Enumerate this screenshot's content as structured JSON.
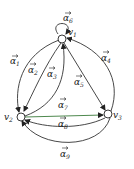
{
  "diagram": {
    "type": "directed-multigraph",
    "vertices": [
      {
        "id": "v1",
        "label": "v",
        "sub": "1"
      },
      {
        "id": "v2",
        "label": "v",
        "sub": "2"
      },
      {
        "id": "v3",
        "label": "v",
        "sub": "3"
      }
    ],
    "edges": [
      {
        "id": "a1",
        "label": "α",
        "sub": "1",
        "from": "v1",
        "to": "v2"
      },
      {
        "id": "a2",
        "label": "α",
        "sub": "2",
        "from": "v1",
        "to": "v2"
      },
      {
        "id": "a3",
        "label": "α",
        "sub": "3",
        "from": "v2",
        "to": "v1"
      },
      {
        "id": "a4",
        "label": "α",
        "sub": "4",
        "from": "v3",
        "to": "v1"
      },
      {
        "id": "a5",
        "label": "α",
        "sub": "5",
        "from": "v1",
        "to": "v3"
      },
      {
        "id": "a6",
        "label": "α",
        "sub": "6",
        "from": "v1",
        "to": "v1"
      },
      {
        "id": "a7",
        "label": "α",
        "sub": "7",
        "from": "v2",
        "to": "v3"
      },
      {
        "id": "a8",
        "label": "α",
        "sub": "8",
        "from": "v3",
        "to": "v2"
      },
      {
        "id": "a9",
        "label": "α",
        "sub": "9",
        "from": "v3",
        "to": "v2"
      }
    ],
    "colors": {
      "stroke": "#333333",
      "edge_a7": "#3a7a3a"
    }
  }
}
